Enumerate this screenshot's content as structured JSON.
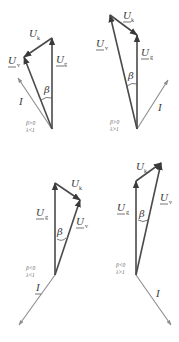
{
  "figure": {
    "colors": {
      "voltage_vector": "#4a4a4a",
      "current_vector": "#8c8c8c",
      "text": "#3a3a3a",
      "condition_text": "#6a6a6a"
    },
    "labels": {
      "U": "U",
      "k": "k",
      "g": "g",
      "v": "v",
      "I": "I",
      "beta": "β"
    },
    "diagrams": [
      {
        "id": "d1",
        "condition_line1": "β>0",
        "condition_line2": "λ<1",
        "origin": [
          52,
          129
        ],
        "ug_tip": [
          52,
          38
        ],
        "uv_tip": [
          24,
          57
        ],
        "uk_from": [
          52,
          38
        ],
        "uk_to": [
          24,
          57
        ],
        "i_tip": [
          18,
          78
        ]
      },
      {
        "id": "d2",
        "condition_line1": "β>0",
        "condition_line2": "λ>1",
        "origin": [
          137,
          129
        ],
        "ug_tip": [
          137,
          35
        ],
        "uv_tip": [
          110,
          15
        ],
        "uk_from": [
          110,
          15
        ],
        "uk_to": [
          137,
          35
        ],
        "i_tip": [
          168,
          80
        ]
      },
      {
        "id": "d3",
        "condition_line1": "β<0",
        "condition_line2": "λ<1",
        "origin": [
          55,
          275
        ],
        "ug_tip": [
          55,
          183
        ],
        "uv_tip": [
          80,
          200
        ],
        "uk_from": [
          55,
          183
        ],
        "uk_to": [
          80,
          200
        ],
        "i_tip": [
          19,
          325
        ]
      },
      {
        "id": "d4",
        "condition_line1": "β<0",
        "condition_line2": "λ>1",
        "origin": [
          136,
          275
        ],
        "ug_tip": [
          136,
          181
        ],
        "uv_tip": [
          161,
          163
        ],
        "uk_from": [
          136,
          181
        ],
        "uk_to": [
          161,
          163
        ],
        "i_tip": [
          171,
          325
        ]
      }
    ]
  }
}
